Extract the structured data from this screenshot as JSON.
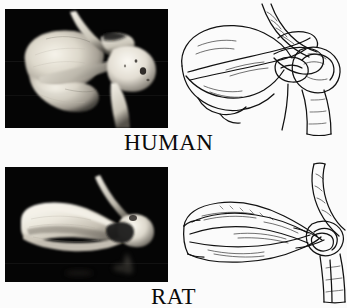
{
  "figure": {
    "kind": "comparative-anatomy-plate",
    "background_color": "#fbfbfb",
    "ink_color": "#0a0a0a",
    "photo_background_color": "#050505",
    "bone_highlight_color": "#f2efe6",
    "rows": [
      {
        "id": "human",
        "label": "HUMAN",
        "photo": {
          "name": "human-shoulder-photograph",
          "subject": "human scapula and proximal humerus, posterior-lateral view",
          "background": "black"
        },
        "drawing": {
          "name": "human-shoulder-line-drawing",
          "subject": "human scapula, clavicle and humeral head line drawing"
        }
      },
      {
        "id": "rat",
        "label": "RAT",
        "photo": {
          "name": "rat-shoulder-photograph",
          "subject": "rat scapula with clavicle and proximal humerus, lateral view",
          "background": "black"
        },
        "drawing": {
          "name": "rat-shoulder-line-drawing",
          "subject": "rat scapula, clavicle and humeral head line drawing"
        }
      }
    ]
  }
}
